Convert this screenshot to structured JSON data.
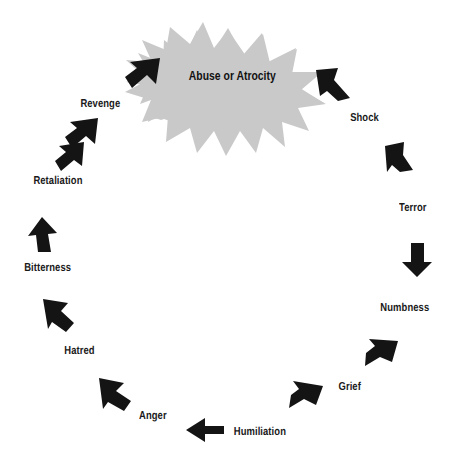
{
  "diagram": {
    "type": "cycle",
    "direction": "clockwise",
    "center": {
      "label": "Abuse or Atrocity",
      "shape": "starburst",
      "color": "#c9c9c9"
    },
    "arrow_color": "#141414",
    "background": "#ffffff",
    "text_color": "#1a1a1a",
    "nodes": [
      {
        "label": "Abuse or Atrocity",
        "index": 0,
        "x": 228,
        "y": 75,
        "role": "center"
      },
      {
        "label": "Shock",
        "index": 1,
        "x": 367,
        "y": 120
      },
      {
        "label": "Terror",
        "index": 2,
        "x": 415,
        "y": 210
      },
      {
        "label": "Numbness",
        "index": 3,
        "x": 405,
        "y": 310
      },
      {
        "label": "Grief",
        "index": 4,
        "x": 352,
        "y": 389
      },
      {
        "label": "Humiliation",
        "index": 5,
        "x": 258,
        "y": 434
      },
      {
        "label": "Anger",
        "index": 6,
        "x": 154,
        "y": 418
      },
      {
        "label": "Hatred",
        "index": 7,
        "x": 82,
        "y": 353
      },
      {
        "label": "Bitterness",
        "index": 8,
        "x": 50,
        "y": 270
      },
      {
        "label": "Retaliation",
        "index": 9,
        "x": 60,
        "y": 183
      },
      {
        "label": "Revenge",
        "index": 10,
        "x": 103,
        "y": 106
      }
    ],
    "arrows": [
      {
        "name": "arrow-to-shock",
        "from": "Abuse or Atrocity",
        "to": "Shock",
        "angle": 52
      },
      {
        "name": "arrow-to-terror",
        "from": "Shock",
        "to": "Terror",
        "angle": 70
      },
      {
        "name": "arrow-to-numbness",
        "from": "Terror",
        "to": "Numbness",
        "angle": 90
      },
      {
        "name": "arrow-to-grief",
        "from": "Numbness",
        "to": "Grief",
        "angle": 128
      },
      {
        "name": "arrow-to-humiliation",
        "from": "Grief",
        "to": "Humiliation",
        "angle": 148
      },
      {
        "name": "arrow-to-anger",
        "from": "Humiliation",
        "to": "Anger",
        "angle": 180
      },
      {
        "name": "arrow-to-hatred",
        "from": "Anger",
        "to": "Hatred",
        "angle": 216
      },
      {
        "name": "arrow-to-bitterness",
        "from": "Hatred",
        "to": "Bitterness",
        "angle": 244
      },
      {
        "name": "arrow-to-retaliation",
        "from": "Bitterness",
        "to": "Retaliation",
        "angle": 276
      },
      {
        "name": "arrow-to-revenge",
        "from": "Retaliation",
        "to": "Revenge",
        "angle": 300
      },
      {
        "name": "arrow-to-abuse",
        "from": "Revenge",
        "to": "Abuse or Atrocity",
        "angle": 330
      }
    ]
  }
}
